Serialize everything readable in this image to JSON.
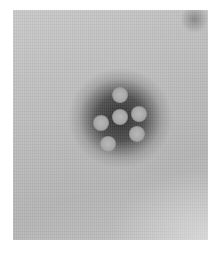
{
  "image": {
    "kind": "electron-micrograph",
    "subject": "particle cluster",
    "colors": {
      "border": "#ffffff",
      "background": "#bdbdbd",
      "halo": "#3a3a3a",
      "particle": "#acacac"
    },
    "particle_count": 6,
    "particles": [
      {
        "name": "top",
        "x": 107,
        "y": 85
      },
      {
        "name": "center",
        "x": 107,
        "y": 107
      },
      {
        "name": "right",
        "x": 126,
        "y": 104
      },
      {
        "name": "left",
        "x": 88,
        "y": 113
      },
      {
        "name": "lower-left",
        "x": 95,
        "y": 134
      },
      {
        "name": "lower-right",
        "x": 124,
        "y": 124
      }
    ]
  }
}
